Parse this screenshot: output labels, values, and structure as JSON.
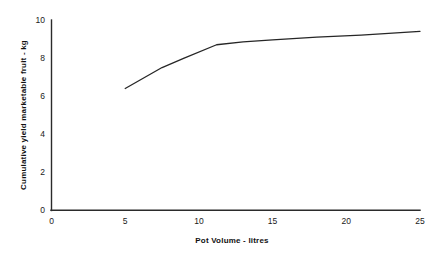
{
  "chart_data": {
    "type": "line",
    "title": "",
    "subtitle": "",
    "xlabel": "Pot Volume - litres",
    "ylabel": "Cumulative yield marketable fruit - kg",
    "xlim": [
      0,
      25
    ],
    "ylim": [
      0,
      10
    ],
    "xticks": [
      0,
      5,
      10,
      15,
      20,
      25
    ],
    "yticks": [
      0,
      2,
      4,
      6,
      8,
      10
    ],
    "xtick_labels": [
      "0",
      "5",
      "10",
      "15",
      "20",
      "25"
    ],
    "ytick_labels": [
      "0",
      "2",
      "4",
      "6",
      "8",
      "10"
    ],
    "grid": false,
    "legend": false,
    "legend_position": "none",
    "line_color": "#262626",
    "background_color": "#ffffff",
    "series": [
      {
        "name": "Cumulative yield marketable fruit",
        "x": [
          5,
          7.5,
          9,
          11.2,
          13,
          15,
          18,
          21,
          25
        ],
        "values": [
          6.4,
          7.5,
          8.0,
          8.7,
          8.85,
          8.95,
          9.1,
          9.2,
          9.4
        ]
      }
    ]
  },
  "axes": {
    "x_label": "Pot Volume - litres",
    "y_label": "Cumulative yield marketable fruit - kg"
  }
}
